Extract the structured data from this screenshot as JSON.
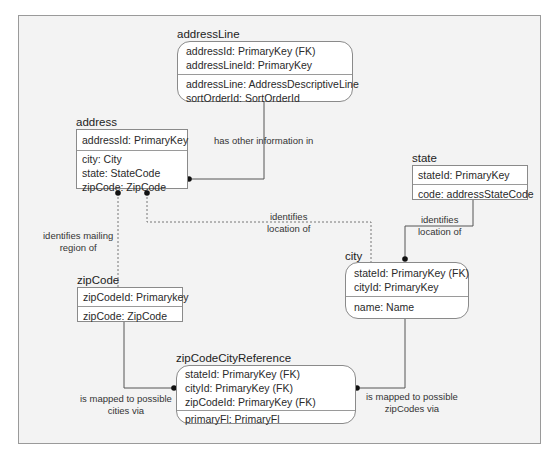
{
  "entities": {
    "addressLine": {
      "title": "addressLine",
      "keys": [
        "addressId: PrimaryKey (FK)",
        "addressLineId: PrimaryKey"
      ],
      "attrs": [
        "addressLine: AddressDescriptiveLine",
        "sortOrderId: SortOrderId"
      ]
    },
    "address": {
      "title": "address",
      "keys": [
        "addressId: PrimaryKey"
      ],
      "attrs": [
        "city: City",
        "state: StateCode",
        "zipCode: ZipCode"
      ]
    },
    "state": {
      "title": "state",
      "keys": [
        "stateId: PrimaryKey"
      ],
      "attrs": [
        "code: addressStateCode"
      ]
    },
    "city": {
      "title": "city",
      "keys": [
        "stateId: PrimaryKey (FK)",
        "cityId: PrimaryKey"
      ],
      "attrs": [
        "name: Name"
      ]
    },
    "zipCode": {
      "title": "zipCode",
      "keys": [
        "zipCodeId: Primarykey"
      ],
      "attrs": [
        "zipCode: ZipCode"
      ]
    },
    "zipCodeCityReference": {
      "title": "zipCodeCityReference",
      "keys": [
        "stateId: PrimaryKey (FK)",
        "cityId: PrimaryKey (FK)",
        "zipCodeId: PrimaryKey (FK)"
      ],
      "attrs": [
        "primaryFl: PrimaryFl"
      ]
    }
  },
  "relationships": {
    "address_addressLine": "has other information in",
    "zipCode_address": [
      "identifies mailing",
      "region of"
    ],
    "address_city": [
      "identifies",
      "location of"
    ],
    "state_city": [
      "identifies",
      "location of"
    ],
    "zipCode_ref": [
      "is mapped to possible",
      "cities via"
    ],
    "city_ref": [
      "is mapped to possible",
      "zipCodes via"
    ]
  }
}
